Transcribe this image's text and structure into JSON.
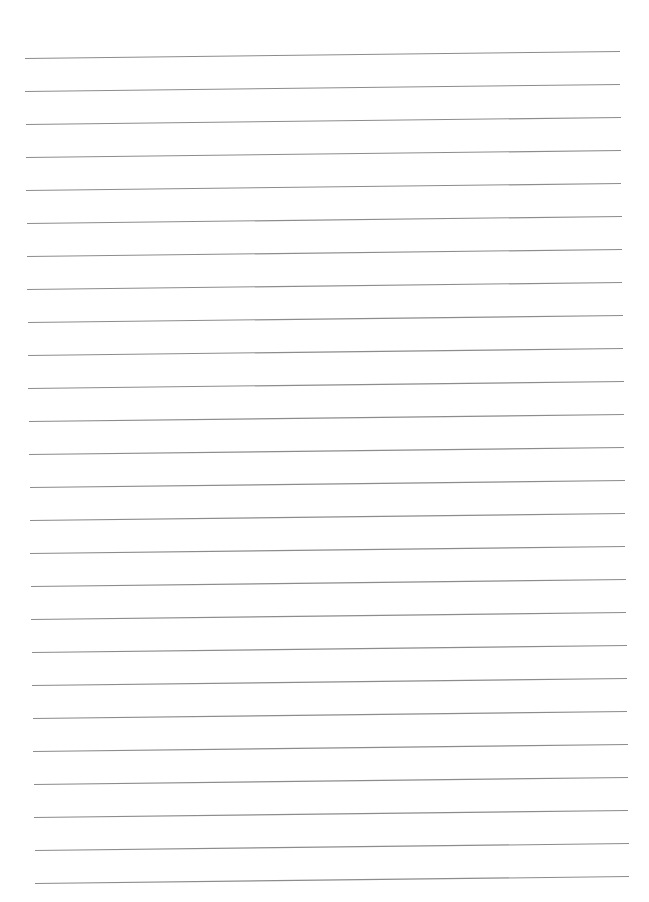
{
  "page": {
    "type": "lined-paper",
    "background": "#ffffff",
    "line_color": "#8c8c8c",
    "line_count": 26
  },
  "lines": [
    {
      "x1": 25,
      "y1": 58.5,
      "x2": 620,
      "y2": 51.5
    },
    {
      "x1": 25,
      "y1": 91.5,
      "x2": 620,
      "y2": 84.5
    },
    {
      "x1": 26,
      "y1": 124.5,
      "x2": 621,
      "y2": 117.5
    },
    {
      "x1": 26,
      "y1": 157.5,
      "x2": 621,
      "y2": 150.5
    },
    {
      "x1": 26,
      "y1": 190.5,
      "x2": 621,
      "y2": 183.5
    },
    {
      "x1": 27,
      "y1": 223.5,
      "x2": 622,
      "y2": 216.5
    },
    {
      "x1": 27,
      "y1": 256.5,
      "x2": 622,
      "y2": 249.5
    },
    {
      "x1": 27,
      "y1": 289.5,
      "x2": 622,
      "y2": 282.5
    },
    {
      "x1": 28,
      "y1": 322.5,
      "x2": 623,
      "y2": 315.5
    },
    {
      "x1": 28,
      "y1": 355.5,
      "x2": 623,
      "y2": 348.5
    },
    {
      "x1": 28,
      "y1": 388.5,
      "x2": 624,
      "y2": 381.5
    },
    {
      "x1": 29,
      "y1": 421.5,
      "x2": 624,
      "y2": 414.5
    },
    {
      "x1": 29,
      "y1": 454.5,
      "x2": 624,
      "y2": 447.5
    },
    {
      "x1": 30,
      "y1": 487.5,
      "x2": 625,
      "y2": 480.5
    },
    {
      "x1": 30,
      "y1": 520.5,
      "x2": 625,
      "y2": 513.5
    },
    {
      "x1": 30,
      "y1": 553.5,
      "x2": 625,
      "y2": 546.5
    },
    {
      "x1": 31,
      "y1": 586.5,
      "x2": 626,
      "y2": 579.5
    },
    {
      "x1": 31,
      "y1": 619.5,
      "x2": 626,
      "y2": 612.5
    },
    {
      "x1": 32,
      "y1": 652.5,
      "x2": 627,
      "y2": 645.5
    },
    {
      "x1": 32,
      "y1": 685.5,
      "x2": 627,
      "y2": 678.5
    },
    {
      "x1": 33,
      "y1": 718.5,
      "x2": 627,
      "y2": 711.5
    },
    {
      "x1": 33,
      "y1": 751.5,
      "x2": 628,
      "y2": 744.5
    },
    {
      "x1": 34,
      "y1": 784.5,
      "x2": 628,
      "y2": 777.5
    },
    {
      "x1": 34,
      "y1": 817.5,
      "x2": 628,
      "y2": 810.5
    },
    {
      "x1": 35,
      "y1": 850.5,
      "x2": 629,
      "y2": 843.5
    },
    {
      "x1": 35,
      "y1": 883.5,
      "x2": 629,
      "y2": 876.5
    }
  ]
}
